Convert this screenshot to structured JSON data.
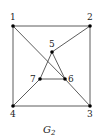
{
  "figure": {
    "caption": "G",
    "caption_subscript": "2",
    "nodes": [
      {
        "id": "1",
        "x": 13,
        "y": 26,
        "lx": 10,
        "ly": 20
      },
      {
        "id": "2",
        "x": 90,
        "y": 26,
        "lx": 87,
        "ly": 20
      },
      {
        "id": "3",
        "x": 90,
        "y": 106,
        "lx": 87,
        "ly": 117
      },
      {
        "id": "4",
        "x": 13,
        "y": 106,
        "lx": 10,
        "ly": 117
      },
      {
        "id": "5",
        "x": 52,
        "y": 52,
        "lx": 49,
        "ly": 47
      },
      {
        "id": "6",
        "x": 65,
        "y": 79,
        "lx": 68,
        "ly": 82
      },
      {
        "id": "7",
        "x": 40,
        "y": 79,
        "lx": 30,
        "ly": 82
      }
    ],
    "edges": [
      [
        "1",
        "2"
      ],
      [
        "1",
        "4"
      ],
      [
        "2",
        "3"
      ],
      [
        "4",
        "3"
      ],
      [
        "1",
        "6"
      ],
      [
        "6",
        "3"
      ],
      [
        "2",
        "5"
      ],
      [
        "5",
        "7"
      ],
      [
        "5",
        "6"
      ],
      [
        "7",
        "6"
      ],
      [
        "7",
        "4"
      ]
    ]
  }
}
